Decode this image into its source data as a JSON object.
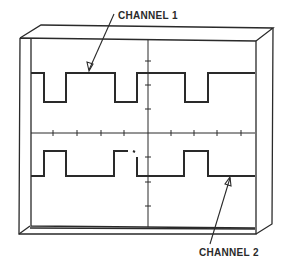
{
  "diagram": {
    "type": "oscilloscope-display",
    "labels": {
      "channel_1": "CHANNEL 1",
      "channel_2": "CHANNEL 2"
    },
    "colors": {
      "ink": "#2a2a2a",
      "background": "#ffffff"
    },
    "graticule": {
      "horizontal_ticks": 8,
      "vertical_ticks": 6
    },
    "traces": [
      {
        "name": "Channel 1",
        "description": "square wave, mostly high with short low pulses",
        "transitions_x": [
          44,
          66,
          115,
          137,
          185,
          208
        ]
      },
      {
        "name": "Channel 2",
        "description": "square wave, mostly low with short high pulses, inverted relative to channel 1",
        "transitions_x": [
          44,
          66,
          114,
          137,
          184,
          208
        ]
      }
    ]
  }
}
